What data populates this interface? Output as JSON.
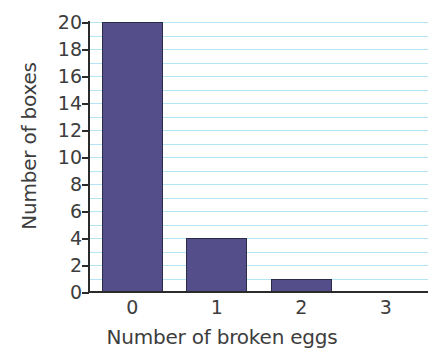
{
  "chart_data": {
    "type": "bar",
    "title": "",
    "subtitle": "",
    "xlabel": "Number of broken eggs",
    "ylabel": "Number of boxes",
    "categories": [
      "0",
      "1",
      "2",
      "3"
    ],
    "values": [
      20,
      4,
      1,
      0
    ],
    "series": [
      {
        "name": "Number of boxes",
        "values": [
          20,
          4,
          1,
          0
        ]
      }
    ],
    "ylim": [
      0,
      20
    ],
    "ytick_values": [
      0,
      2,
      4,
      6,
      8,
      10,
      12,
      14,
      16,
      18,
      20
    ],
    "ytick_labels": [
      "0",
      "2",
      "4",
      "6",
      "8",
      "10",
      "12",
      "14",
      "16",
      "18",
      "20"
    ],
    "ytick_step": 2,
    "gridline_values": [
      1,
      2,
      3,
      4,
      5,
      6,
      7,
      8,
      9,
      10,
      11,
      12,
      13,
      14,
      15,
      16,
      17,
      18,
      19,
      20
    ],
    "gridline_step": 1,
    "grid": true,
    "grid_axis": "y",
    "legend": false,
    "legend_position": "none",
    "annotations": [],
    "bar_width_fraction": 0.72,
    "colors": {
      "bar_fill": "#544f8a",
      "bar_edge": "#2b2b4c",
      "gridline": "#b3e5f4",
      "axis": "#2b2b2b",
      "text": "#3d3d3d",
      "background": "#ffffff"
    }
  }
}
